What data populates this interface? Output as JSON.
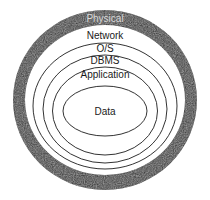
{
  "diagram": {
    "type": "concentric-layers",
    "colors": {
      "outer_ring": "#2a2a2a",
      "lines": "#333333",
      "background": "#ffffff",
      "text": "#1a1a1a"
    },
    "layers": [
      {
        "label": "Physical",
        "order": 1
      },
      {
        "label": "Network",
        "order": 2
      },
      {
        "label": "O/S",
        "order": 3
      },
      {
        "label": "DBMS",
        "order": 4
      },
      {
        "label": "Application",
        "order": 5
      },
      {
        "label": "Data",
        "order": 6
      }
    ]
  }
}
